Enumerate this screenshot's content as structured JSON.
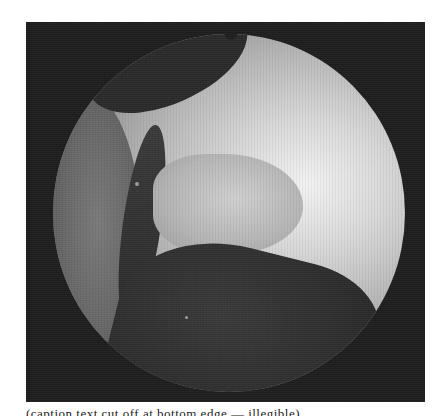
{
  "figure": {
    "type": "endoscopic-photograph",
    "color_mode": "grayscale",
    "field_shape": "circular",
    "caption_visible_partial": "(caption text cut off at bottom edge — illegible)"
  },
  "colors": {
    "frame_background": "#1e1e1e",
    "page_background": "#ffffff",
    "highlight": "#f2f2f2",
    "shadow": "#2a2a2a"
  }
}
